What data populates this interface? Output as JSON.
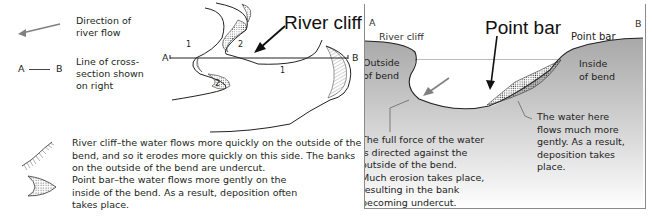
{
  "legend": {
    "flow": {
      "icon": "arrow-left-icon",
      "text_line1": "Direction of",
      "text_line2": "river flow"
    },
    "section": {
      "a": "A",
      "b": "B",
      "text_line1": "Line of cross-",
      "text_line2": "section shown",
      "text_line3": "on right"
    },
    "river_cliff": {
      "icon": "hatched-cliff-icon",
      "lines": [
        "River cliff–the water flows more quickly on the outside of the",
        "bend, and so it erodes more quickly on this side. The banks",
        "on the outside of the bend are undercut."
      ]
    },
    "point_bar": {
      "icon": "stippled-bar-icon",
      "lines": [
        "Point bar–the water flows more gently on the",
        "inside of the bend. As a result, deposition often",
        "takes place."
      ]
    }
  },
  "plan_view": {
    "title": "River cliff",
    "label_a": "A",
    "label_b": "B",
    "numbers": [
      "1",
      "2",
      "2",
      "1"
    ]
  },
  "cross_section": {
    "title": "Point bar",
    "corner_a": "A",
    "corner_b": "B",
    "left_top_label": "River cliff",
    "right_top_label": "Point bar",
    "outside": [
      "Outside",
      "of bend"
    ],
    "inside": [
      "Inside",
      "of bend"
    ],
    "left_note": [
      "The full force of the water",
      "is directed against the",
      "outside of the bend.",
      "Much erosion takes place,",
      "resulting in the bank",
      "becoming undercut."
    ],
    "right_note": [
      "The water here",
      "flows much more",
      "gently. As a result,",
      "deposition takes",
      "place."
    ]
  },
  "colors": {
    "bank_fill": "#a9a9a9",
    "ink": "#231f20",
    "arrow_gray": "#808080",
    "panel_border": "#8a8a8a"
  }
}
